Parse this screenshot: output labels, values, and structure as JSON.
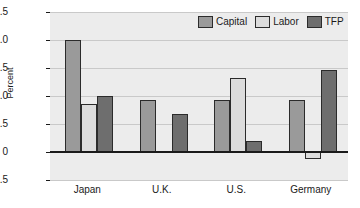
{
  "chart_data": {
    "type": "bar",
    "title": "",
    "xlabel": "",
    "ylabel": "Percent",
    "categories": [
      "Japan",
      "U.K.",
      "U.S.",
      "Germany"
    ],
    "series": [
      {
        "name": "Capital",
        "color": "#9a9a9a",
        "values": [
          2.0,
          0.92,
          0.92,
          0.92
        ]
      },
      {
        "name": "Labor",
        "color": "#dcdcdc",
        "values": [
          0.85,
          0.0,
          1.32,
          -0.13
        ]
      },
      {
        "name": "TFP",
        "color": "#6e6e6e",
        "values": [
          1.0,
          0.68,
          0.2,
          1.47
        ]
      }
    ],
    "ylim": [
      -0.5,
      2.5
    ],
    "yticks": [
      "2.5",
      "2.0",
      "1.5",
      "1.0",
      "0.5",
      "0",
      "-0.5"
    ],
    "ytick_values": [
      2.5,
      2.0,
      1.5,
      1.0,
      0.5,
      0,
      -0.5
    ],
    "grid": true,
    "legend_position": "top-right",
    "plot_background": "#ececec",
    "axis_color": "#1a1a1a",
    "gridline_color": "#c9c9c9"
  },
  "legend": {
    "items": [
      {
        "label": "Capital"
      },
      {
        "label": "Labor"
      },
      {
        "label": "TFP"
      }
    ]
  }
}
